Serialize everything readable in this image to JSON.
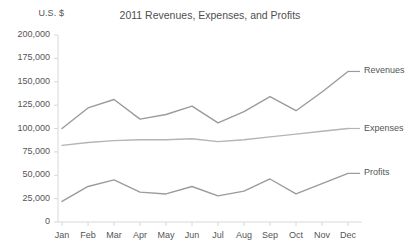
{
  "chart_data": {
    "type": "line",
    "title": "2011 Revenues, Expenses, and Profits",
    "unit_label": "U.S. $",
    "xlabel": "",
    "ylabel": "U.S. $",
    "grid": false,
    "legend_position": "right-inline-labels",
    "categories": [
      "Jan",
      "Feb",
      "Mar",
      "Apr",
      "May",
      "Jun",
      "Jul",
      "Aug",
      "Sep",
      "Oct",
      "Nov",
      "Dec"
    ],
    "ylim": [
      0,
      200000
    ],
    "ytick_labels": [
      "200,000",
      "175,000",
      "150,000",
      "125,000",
      "100,000",
      "75,000",
      "50,000",
      "25,000",
      "0"
    ],
    "ytick_values": [
      200000,
      175000,
      150000,
      125000,
      100000,
      75000,
      50000,
      25000,
      0
    ],
    "series": [
      {
        "name": "Revenues",
        "color": "#9b9b9b",
        "values": [
          100000,
          122000,
          131000,
          110000,
          115000,
          124000,
          106000,
          118000,
          134000,
          119000,
          139000,
          161000
        ]
      },
      {
        "name": "Expenses",
        "color": "#b4b4b4",
        "values": [
          82000,
          85000,
          87000,
          88000,
          88000,
          89000,
          86000,
          88000,
          91000,
          94000,
          97000,
          100000
        ]
      },
      {
        "name": "Profits",
        "color": "#9b9b9b",
        "values": [
          22000,
          38000,
          45000,
          32000,
          30000,
          38000,
          28000,
          33000,
          46000,
          30000,
          41000,
          52000
        ]
      }
    ]
  },
  "axis": {
    "line_color": "#d8d8d8"
  }
}
